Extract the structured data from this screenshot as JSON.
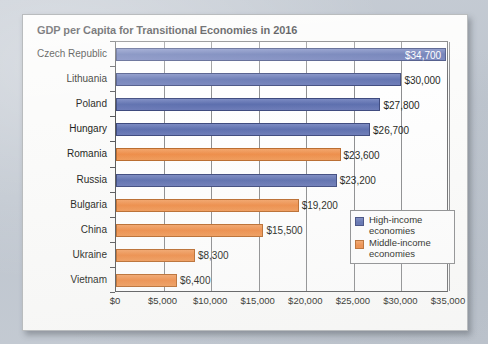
{
  "card": {
    "title": "GDP per Capita for Transitional Economies in 2016"
  },
  "legend": {
    "items": [
      {
        "label_line1": "High-income",
        "label_line2": "economies",
        "swatch": "high",
        "color": "#5d6fae"
      },
      {
        "label_line1": "Middle-income",
        "label_line2": "economies",
        "swatch": "middle",
        "color": "#ee8c47"
      }
    ]
  },
  "chart_data": {
    "type": "bar",
    "orientation": "horizontal",
    "title": "GDP per Capita for Transitional Economies in 2016",
    "xlabel": "",
    "ylabel": "",
    "xlim": [
      0,
      35000
    ],
    "xtick_labels": [
      "$0",
      "$5,000",
      "$10,000",
      "$15,000",
      "$20,000",
      "$25,000",
      "$30,000",
      "$35,000"
    ],
    "xticks": [
      0,
      5000,
      10000,
      15000,
      20000,
      25000,
      30000,
      35000
    ],
    "grid": true,
    "legend_position": "inside-right-lower",
    "categories": [
      "Czech Republic",
      "Lithuania",
      "Poland",
      "Hungary",
      "Romania",
      "Russia",
      "Bulgaria",
      "China",
      "Ukraine",
      "Vietnam"
    ],
    "values": [
      34700,
      30000,
      27800,
      26700,
      23600,
      23200,
      19200,
      15500,
      8300,
      6400
    ],
    "value_labels": [
      "$34,700",
      "$30,000",
      "$27,800",
      "$26,700",
      "$23,600",
      "$23,200",
      "$19,200",
      "$15,500",
      "$8,300",
      "$6,400"
    ],
    "label_inside": [
      true,
      false,
      false,
      false,
      false,
      false,
      false,
      false,
      false,
      false
    ],
    "groups": [
      "high",
      "high",
      "high",
      "high",
      "middle",
      "high",
      "middle",
      "middle",
      "middle",
      "middle"
    ],
    "series": [
      {
        "name": "High-income economies",
        "color": "#5d6fae"
      },
      {
        "name": "Middle-income economies",
        "color": "#ee8c47"
      }
    ]
  }
}
